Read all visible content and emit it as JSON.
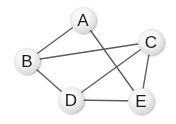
{
  "diagram": {
    "type": "undirected-graph",
    "colors": {
      "edge": "#5e5e5e",
      "node_fill_light": "#ffffff",
      "node_fill_dark": "#dcdcdc",
      "label": "#1c1c1c",
      "background": "#ffffff"
    },
    "node_radius": 12.5,
    "nodes": [
      {
        "id": "A",
        "label": "A",
        "x": 83,
        "y": 20
      },
      {
        "id": "B",
        "label": "B",
        "x": 27,
        "y": 61
      },
      {
        "id": "C",
        "label": "C",
        "x": 151,
        "y": 42
      },
      {
        "id": "D",
        "label": "D",
        "x": 71,
        "y": 100
      },
      {
        "id": "E",
        "label": "E",
        "x": 141,
        "y": 101
      }
    ],
    "edges": [
      {
        "from": "A",
        "to": "B"
      },
      {
        "from": "A",
        "to": "E"
      },
      {
        "from": "B",
        "to": "C"
      },
      {
        "from": "B",
        "to": "D"
      },
      {
        "from": "C",
        "to": "D"
      },
      {
        "from": "C",
        "to": "E"
      },
      {
        "from": "D",
        "to": "E"
      }
    ]
  }
}
